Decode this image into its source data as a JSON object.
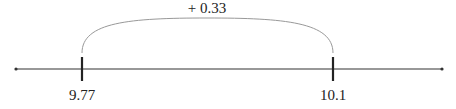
{
  "diagram": {
    "type": "number-line-jump",
    "start_value": "9.77",
    "end_value": "10.1",
    "jump_label": "+ 0.33",
    "colors": {
      "line": "#333333",
      "arc": "#999999",
      "tick": "#222222"
    }
  }
}
